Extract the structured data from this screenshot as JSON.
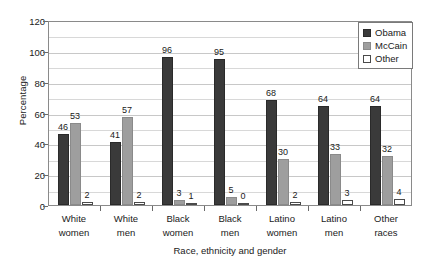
{
  "chart_data": {
    "type": "bar",
    "title": "",
    "xlabel": "Race, ethnicity and gender",
    "ylabel": "Percentage",
    "ylim": [
      0,
      120
    ],
    "yticks": [
      0,
      20,
      40,
      60,
      80,
      100,
      120
    ],
    "minor_gridlines": true,
    "grid": true,
    "legend_position": "top-right",
    "categories": [
      "White women",
      "White men",
      "Black women",
      "Black men",
      "Latino women",
      "Latino men",
      "Other races"
    ],
    "category_lines": [
      [
        "White",
        "women"
      ],
      [
        "White",
        "men"
      ],
      [
        "Black",
        "women"
      ],
      [
        "Black",
        "men"
      ],
      [
        "Latino",
        "women"
      ],
      [
        "Latino",
        "men"
      ],
      [
        "Other",
        "races"
      ]
    ],
    "series": [
      {
        "name": "Obama",
        "color": "#3a3a3a",
        "values": [
          46,
          41,
          96,
          95,
          68,
          64,
          64
        ]
      },
      {
        "name": "McCain",
        "color": "#9e9e9e",
        "values": [
          53,
          57,
          3,
          5,
          30,
          33,
          32
        ]
      },
      {
        "name": "Other",
        "color": "#ffffff",
        "values": [
          2,
          2,
          1,
          0,
          2,
          3,
          4
        ]
      }
    ]
  },
  "legend": {
    "items": [
      {
        "label": "Obama",
        "swatch": "obama"
      },
      {
        "label": "McCain",
        "swatch": "mccain"
      },
      {
        "label": "Other",
        "swatch": "other"
      }
    ]
  },
  "axes": {
    "y_title": "Percentage",
    "x_title": "Race, ethnicity and gender",
    "y_tick_labels": [
      "0",
      "20",
      "40",
      "60",
      "80",
      "100",
      "120"
    ]
  }
}
